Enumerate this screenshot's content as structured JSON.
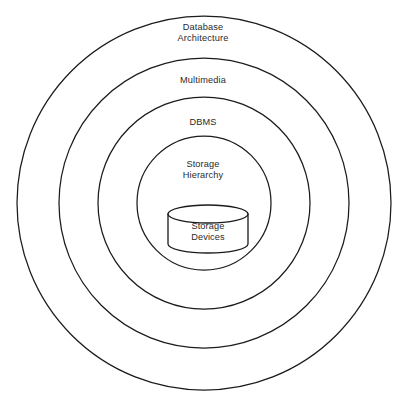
{
  "diagram": {
    "type": "concentric-rings",
    "background_color": "#ffffff",
    "stroke_color": "#1b1b1b",
    "text_color": "#2a2a2a",
    "center": {
      "x": 204,
      "y": 203
    },
    "rings": [
      {
        "name": "database-architecture",
        "label": "Database\nArchitecture",
        "level": 1,
        "radius": 187
      },
      {
        "name": "multimedia",
        "label": "Multimedia",
        "level": 2,
        "radius": 145
      },
      {
        "name": "dbms",
        "label": "DBMS",
        "level": 3,
        "radius": 106
      },
      {
        "name": "storage-hierarchy",
        "label": "Storage\nHierarchy",
        "level": 4,
        "radius": 67
      }
    ],
    "core": {
      "name": "storage-devices",
      "icon": "database-cylinder-icon",
      "label": "Storage\nDevices",
      "left": 168,
      "right": 248,
      "top": 205,
      "bottom": 253,
      "ellipse_ry": 9
    }
  }
}
